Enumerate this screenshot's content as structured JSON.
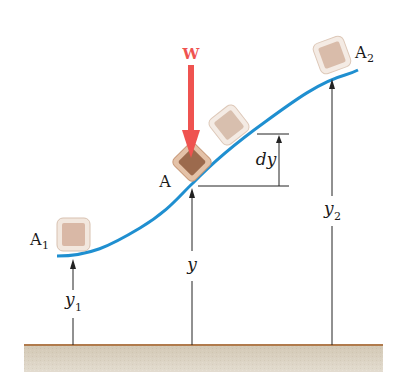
{
  "labels": {
    "force": "W",
    "point_a": "A",
    "point_a1": "A",
    "point_a1_sub": "1",
    "point_a2": "A",
    "point_a2_sub": "2",
    "dy": "dy",
    "y": "y",
    "y1": "y",
    "y1_sub": "1",
    "y2": "y",
    "y2_sub": "2"
  },
  "colors": {
    "curve": "#1f8fd0",
    "force_arrow": "#ef5350",
    "ground_top": "#b07a4c",
    "ground_fill": "#d9cfbe",
    "block_fill": "#e3cfc0",
    "block_border": "#f1e6dc",
    "block_dark": "#9c6a4d",
    "line": "#222222"
  }
}
